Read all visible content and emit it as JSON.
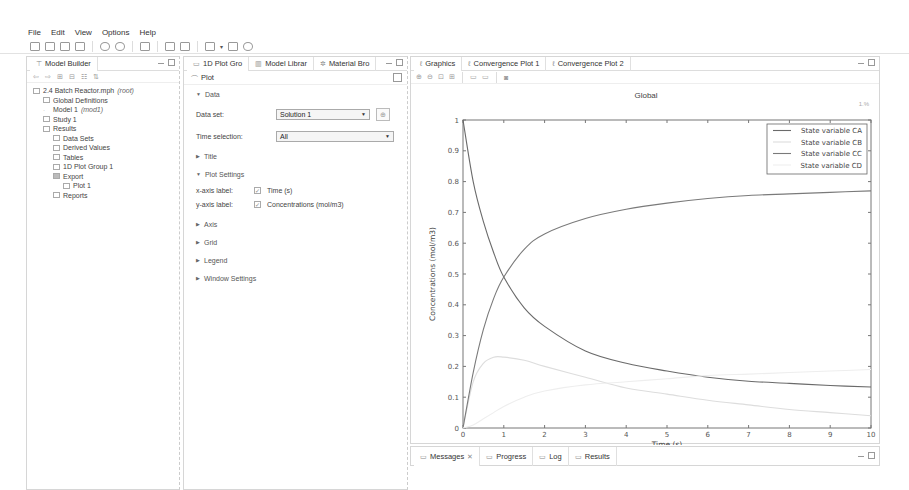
{
  "menu": [
    "File",
    "Edit",
    "View",
    "Options",
    "Help"
  ],
  "toolbar": {
    "icons": [
      "new-icon",
      "open-icon",
      "save-icon",
      "print-icon",
      "undo-icon",
      "redo-icon",
      "build-icon",
      "window-icon",
      "window2-icon",
      "compute-icon",
      "dropdown-icon",
      "view-icon",
      "camera-icon"
    ]
  },
  "model_builder": {
    "tab_label": "Model Builder",
    "toolbar_icons": [
      "back-icon",
      "forward-icon",
      "expand-icon",
      "collapse-icon",
      "show-icon",
      "sort-icon"
    ],
    "tree": [
      {
        "label": "2.4 Batch Reactor.mph",
        "suffix": "(root)",
        "level": 0
      },
      {
        "label": "Global Definitions",
        "suffix": "",
        "level": 1
      },
      {
        "label": "Model 1",
        "suffix": "(mod1)",
        "level": 1
      },
      {
        "label": "Study 1",
        "suffix": "",
        "level": 1
      },
      {
        "label": "Results",
        "suffix": "",
        "level": 1
      },
      {
        "label": "Data Sets",
        "suffix": "",
        "level": 2
      },
      {
        "label": "Derived Values",
        "suffix": "",
        "level": 2
      },
      {
        "label": "Tables",
        "suffix": "",
        "level": 2
      },
      {
        "label": "1D Plot Group 1",
        "suffix": "",
        "level": 2
      },
      {
        "label": "Export",
        "suffix": "",
        "level": 2
      },
      {
        "label": "Plot 1",
        "suffix": "",
        "level": 3
      },
      {
        "label": "Reports",
        "suffix": "",
        "level": 2
      }
    ]
  },
  "settings": {
    "tabs": [
      "1D Plot Gro",
      "Model Librar",
      "Material Bro"
    ],
    "title": "Plot",
    "sections": {
      "data": "Data",
      "title": "Title",
      "plot_settings": "Plot Settings",
      "axis": "Axis",
      "grid": "Grid",
      "legend": "Legend",
      "window_settings": "Window Settings"
    },
    "data_set_label": "Data set:",
    "data_set_value": "Solution 1",
    "time_selection_label": "Time selection:",
    "time_selection_value": "All",
    "x_axis_label": "x-axis label:",
    "x_axis_value": "Time (s)",
    "y_axis_label": "y-axis label:",
    "y_axis_value": "Concentrations (mol/m3)"
  },
  "graphics": {
    "tabs": [
      "Graphics",
      "Convergence Plot 1",
      "Convergence Plot 2"
    ],
    "toolbar_icons": [
      "zoom-in-icon",
      "zoom-out-icon",
      "zoom-box-icon",
      "zoom-extents-icon",
      "axis-icon",
      "scene-light-icon",
      "image-snapshot-icon"
    ],
    "corner_label": "1.%"
  },
  "bottom": {
    "tabs": [
      "Messages",
      "Progress",
      "Log",
      "Results"
    ]
  },
  "chart_data": {
    "type": "line",
    "title": "Global",
    "xlabel": "Time (s)",
    "ylabel": "Concentrations (mol/m3)",
    "xlim": [
      0,
      10
    ],
    "ylim": [
      0,
      1
    ],
    "xticks": [
      0,
      1,
      2,
      3,
      4,
      5,
      6,
      7,
      8,
      9,
      10
    ],
    "yticks": [
      0,
      0.1,
      0.2,
      0.3,
      0.4,
      0.5,
      0.6,
      0.7,
      0.8,
      0.9,
      1
    ],
    "grid": false,
    "legend_position": "top-right",
    "x": [
      0,
      0.25,
      0.5,
      0.75,
      1,
      1.5,
      2,
      3,
      4,
      5,
      6,
      7,
      8,
      9,
      10
    ],
    "series": [
      {
        "name": "State variable CA",
        "color": "#6a6a6a",
        "values": [
          1.0,
          0.8,
          0.67,
          0.57,
          0.49,
          0.39,
          0.33,
          0.25,
          0.21,
          0.185,
          0.165,
          0.152,
          0.145,
          0.138,
          0.133
        ]
      },
      {
        "name": "State variable CB",
        "color": "#dddddd",
        "values": [
          0,
          0.15,
          0.21,
          0.23,
          0.23,
          0.22,
          0.2,
          0.165,
          0.13,
          0.11,
          0.09,
          0.075,
          0.06,
          0.05,
          0.04
        ]
      },
      {
        "name": "State variable CC",
        "color": "#7a7a7a",
        "values": [
          0,
          0.18,
          0.32,
          0.42,
          0.49,
          0.58,
          0.63,
          0.68,
          0.71,
          0.73,
          0.745,
          0.755,
          0.76,
          0.765,
          0.77
        ]
      },
      {
        "name": "State variable CD",
        "color": "#eeeeee",
        "values": [
          0,
          0.01,
          0.03,
          0.05,
          0.07,
          0.1,
          0.12,
          0.14,
          0.15,
          0.16,
          0.17,
          0.175,
          0.18,
          0.185,
          0.19
        ]
      }
    ]
  }
}
